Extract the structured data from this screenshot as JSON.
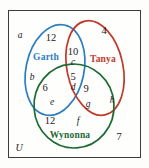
{
  "diagram": {
    "type": "venn-3-set",
    "universe_label": "U",
    "sets": [
      {
        "name": "Garth",
        "color": "#2a7fc1"
      },
      {
        "name": "Tanya",
        "color": "#c0392b"
      },
      {
        "name": "Wynonna",
        "color": "#1d6b33"
      }
    ],
    "region_counts": [
      {
        "region": "garth-only",
        "value": "12"
      },
      {
        "region": "tanya-only",
        "value": "4"
      },
      {
        "region": "wynonna-only",
        "value": "12"
      },
      {
        "region": "garth-tanya",
        "value": "10"
      },
      {
        "region": "garth-wynonna",
        "value": "6"
      },
      {
        "region": "tanya-wynonna",
        "value": "9"
      },
      {
        "region": "garth-tanya-wynonna",
        "value": "5"
      },
      {
        "region": "outside-all",
        "value": "7"
      }
    ],
    "region_letters": [
      {
        "region": "outside-all-upper-left",
        "label": "a"
      },
      {
        "region": "garth-only",
        "label": "b"
      },
      {
        "region": "garth-tanya",
        "label": "c"
      },
      {
        "region": "garth-tanya-wynonna",
        "label": "d"
      },
      {
        "region": "garth-wynonna",
        "label": "e"
      },
      {
        "region": "wynonna-only",
        "label": "f"
      },
      {
        "region": "tanya-wynonna",
        "label": "g"
      },
      {
        "region": "tanya-only-lower",
        "label": "h"
      }
    ]
  }
}
